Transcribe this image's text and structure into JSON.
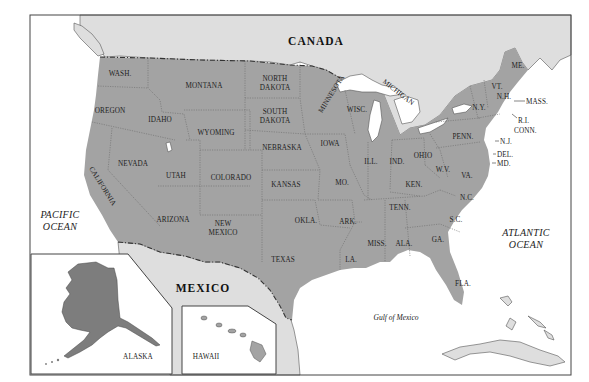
{
  "map": {
    "title": "United States reference map",
    "colors": {
      "us_land": "#a3a3a3",
      "foreign_land": "#dedede",
      "water": "#ffffff",
      "alaska": "#7d7d7d",
      "border": "#333333"
    },
    "countries": {
      "canada": "CANADA",
      "mexico": "MEXICO"
    },
    "water_bodies": {
      "pacific": [
        "PACIFIC",
        "OCEAN"
      ],
      "atlantic": [
        "ATLANTIC",
        "OCEAN"
      ],
      "gulf": "Gulf of Mexico"
    },
    "insets": {
      "alaska": "ALASKA",
      "hawaii": "HAWAII"
    },
    "states": {
      "wash": "WASH.",
      "oregon": "OREGON",
      "california": "CALIFORNIA",
      "idaho": "IDAHO",
      "nevada": "NEVADA",
      "montana": "MONTANA",
      "wyoming": "WYOMING",
      "utah": "UTAH",
      "arizona": "ARIZONA",
      "colorado": "COLORADO",
      "new_mexico": [
        "NEW",
        "MEXICO"
      ],
      "north_dakota": [
        "NORTH",
        "DAKOTA"
      ],
      "south_dakota": [
        "SOUTH",
        "DAKOTA"
      ],
      "nebraska": "NEBRASKA",
      "kansas": "KANSAS",
      "okla": "OKLA.",
      "texas": "TEXAS",
      "minnesota": "MINNESOTA",
      "iowa": "IOWA",
      "mo": "MO.",
      "ark": "ARK.",
      "la": "LA.",
      "wisc": "WISC.",
      "ill": "ILL.",
      "michigan": "MICHIGAN",
      "ind": "IND.",
      "ohio": "OHIO",
      "ken": "KEN.",
      "tenn": "TENN.",
      "miss": "MISS.",
      "ala": "ALA.",
      "ga": "GA.",
      "fla": "FLA.",
      "sc": "S.C.",
      "nc": "N.C.",
      "va": "VA.",
      "wv": "W.V.",
      "penn": "PENN.",
      "ny": "N.Y.",
      "vt": "VT.",
      "nh": "N.H.",
      "me": "ME.",
      "mass": "MASS.",
      "ri": "R.I.",
      "conn": "CONN.",
      "nj": "N.J.",
      "del": "DEL.",
      "md": "MD."
    }
  }
}
